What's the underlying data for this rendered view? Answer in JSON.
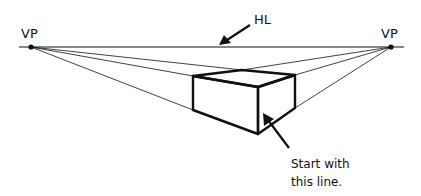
{
  "diagram": {
    "labels": {
      "vp_left": "VP",
      "vp_right": "VP",
      "horizon": "HL",
      "instruction_line1": "Start with",
      "instruction_line2": "this line."
    },
    "colors": {
      "background": "#ffffff",
      "ink": "#111111"
    },
    "points": {
      "vp_left": [
        31,
        47
      ],
      "vp_right": [
        391,
        47
      ],
      "box_left_top": [
        193,
        76
      ],
      "box_back_top": [
        242,
        70
      ],
      "box_right_top": [
        295,
        75
      ],
      "box_front_top": [
        258,
        87
      ],
      "box_left_bottom": [
        193,
        110
      ],
      "box_front_bottom": [
        258,
        134
      ],
      "box_right_bottom": [
        295,
        108
      ]
    }
  }
}
